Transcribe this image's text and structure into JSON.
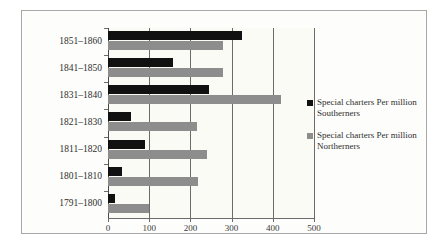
{
  "chart_data": {
    "type": "bar",
    "orientation": "horizontal",
    "title": "",
    "xlabel": "",
    "ylabel": "",
    "xlim": [
      0,
      500
    ],
    "xticks": [
      0,
      100,
      200,
      300,
      400,
      500
    ],
    "xtick_labels": [
      "0",
      "100",
      "200",
      "300",
      "400",
      "500"
    ],
    "grid": true,
    "legend_position": "right",
    "categories": [
      "1851–1860",
      "1841–1850",
      "1831–1840",
      "1821–1830",
      "1811–1820",
      "1801–1810",
      "1791–1800"
    ],
    "series": [
      {
        "name": "Special charters Per million Southerners",
        "color": "#111111",
        "values": [
          325,
          158,
          245,
          55,
          90,
          33,
          18
        ]
      },
      {
        "name": "Special charters Per million Northerners",
        "color": "#8d8d8d",
        "values": [
          280,
          280,
          420,
          215,
          240,
          218,
          100
        ]
      }
    ]
  },
  "legend": {
    "items": [
      {
        "label": "Special charters Per million Southerners",
        "swatch": "legend-swatch-southerners",
        "color": "#111111"
      },
      {
        "label": "Special charters Per million Northerners",
        "swatch": "legend-swatch-northerners",
        "color": "#8d8d8d"
      }
    ]
  }
}
